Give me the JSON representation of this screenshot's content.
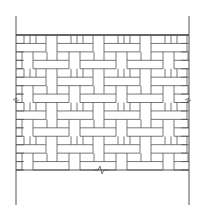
{
  "diagram": {
    "stroke_color": "#555555",
    "heavy_stroke_color": "#333333",
    "background": "#ffffff",
    "wall": {
      "left_x": 16,
      "right_x": 189,
      "top_y": 35,
      "bottom_y": 170,
      "post_extend_top": 16,
      "post_extend_bottom": 205
    },
    "rows": 16,
    "row_height": 8.44,
    "period_x": 47,
    "offset_x": 0,
    "break_marks": [
      {
        "side": "left",
        "y": 100
      },
      {
        "side": "right",
        "y": 100
      },
      {
        "side": "bottom",
        "x": 100,
        "y": 170
      }
    ]
  }
}
